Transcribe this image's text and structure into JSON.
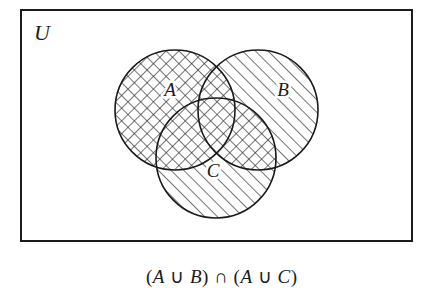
{
  "figure": {
    "type": "venn-diagram",
    "set_count": 3,
    "universe_label": "U",
    "caption": "(A ∪ B) ∩ (A ∪ C)",
    "caption_parts": {
      "open1": "(",
      "a1": "A",
      "union1": "∪",
      "b": "B",
      "close1": ")",
      "intersect": "∩",
      "open2": "(",
      "a2": "A",
      "union2": "∪",
      "c": "C",
      "close2": ")"
    },
    "expression": {
      "left_operand": "A ∪ B",
      "operator": "∩",
      "right_operand": "A ∪ C",
      "simplified": "A ∪ (B ∩ C)"
    },
    "colors": {
      "ink": "#1b1b1b",
      "background": "#ffffff",
      "hatch": "#2a2a2a",
      "border": "#1b1b1b"
    },
    "rectangle": {
      "name": "universal-set-box",
      "x": 21,
      "y": 10,
      "width": 391,
      "height": 231,
      "stroke_width": 2
    },
    "circles": [
      {
        "label": "A",
        "cx": 175,
        "cy": 110,
        "r": 60,
        "fill": "crosshatch",
        "label_x": 170,
        "label_y": 96
      },
      {
        "label": "B",
        "cx": 258,
        "cy": 110,
        "r": 60,
        "fill": "diagonal",
        "label_x": 283,
        "label_y": 96
      },
      {
        "label": "C",
        "cx": 216,
        "cy": 158,
        "r": 60,
        "fill": "diagonal",
        "label_x": 213,
        "label_y": 177
      }
    ],
    "shaded_regions": [
      {
        "name": "circle-A-full",
        "pattern": "crosshatch",
        "description": "all of set A"
      },
      {
        "name": "B-intersect-C-outside-A",
        "pattern": "crosshatch",
        "description": "overlap of B and C not in A"
      },
      {
        "name": "B-only",
        "pattern": "diagonal",
        "description": "set B outside the highlighted result"
      },
      {
        "name": "C-only",
        "pattern": "diagonal",
        "description": "set C outside the highlighted result"
      }
    ]
  }
}
